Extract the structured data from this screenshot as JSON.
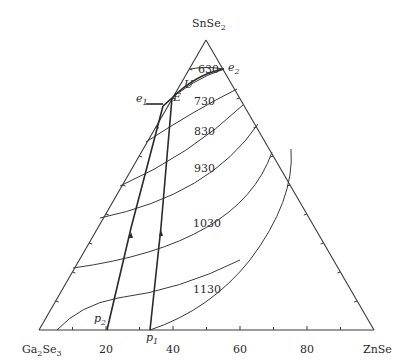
{
  "diagram": {
    "type": "ternary-phase-diagram",
    "vertices": {
      "top": "SnSe2",
      "left": "Ga2Se3",
      "right": "ZnSe"
    },
    "vertex_labels": {
      "top_main": "SnSe",
      "top_sub": "2",
      "left_main": "Ga",
      "left_sub1": "2",
      "left_mid": "Se",
      "left_sub2": "3",
      "right": "ZnSe"
    },
    "bottom_axis_ticks": [
      "20",
      "40",
      "60",
      "80"
    ],
    "isotherms": [
      "630",
      "730",
      "830",
      "930",
      "1030",
      "1130"
    ],
    "points": {
      "e1": {
        "main": "e",
        "sub": "1"
      },
      "e2": {
        "main": "e",
        "sub": "2"
      },
      "E": {
        "main": "E"
      },
      "U": {
        "main": "U"
      },
      "p1": {
        "main": "p",
        "sub": "1"
      },
      "p2": {
        "main": "p",
        "sub": "2"
      }
    }
  }
}
